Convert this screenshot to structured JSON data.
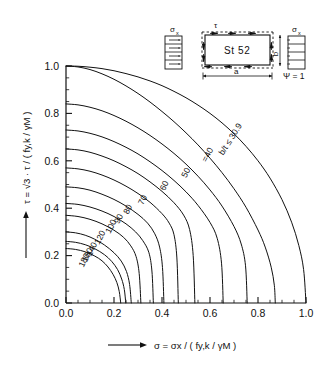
{
  "figure": {
    "material_label": "St 52",
    "psi_label": "Ψ = 1",
    "sigma_label_left": "σ",
    "sigma_sub_left": "x",
    "sigma_label_right": "σ",
    "sigma_sub_right": "x",
    "tau_label": "τ",
    "dim_a": "a",
    "dim_b": "b"
  },
  "axes": {
    "x": {
      "label_main": "σ",
      "label_full": "σ = σx / ( fy,k / γM )",
      "ticks": [
        "0.0",
        "0.2",
        "0.4",
        "0.6",
        "0.8",
        "1.0"
      ],
      "tick_values": [
        0.0,
        0.2,
        0.4,
        0.6,
        0.8,
        1.0
      ],
      "range": [
        0.0,
        1.0
      ],
      "minor_step": 0.05
    },
    "y": {
      "label_full": "τ = √3 · τ / ( fy,k / γM )",
      "ticks": [
        "0.0",
        "0.2",
        "0.4",
        "0.6",
        "0.8",
        "1.0"
      ],
      "tick_values": [
        0.0,
        0.2,
        0.4,
        0.6,
        0.8,
        1.0
      ],
      "range": [
        0.0,
        1.0
      ],
      "minor_step": 0.05
    }
  },
  "chart_data": {
    "type": "line",
    "title": "",
    "xlabel": "σ = σx / ( fy,k / γM )",
    "ylabel": "τ = √3 · τ / ( fy,k / γM )",
    "xlim": [
      0.0,
      1.0
    ],
    "ylim": [
      0.0,
      1.0
    ],
    "grid": false,
    "legend": "inline-curve-labels",
    "legend_title": "b/t",
    "series": [
      {
        "name": "b/t ≤ 30.9",
        "label": "b/t ≤ 30.9",
        "label_pos": [
          0.695,
          0.685
        ],
        "label_rot": -58,
        "x": [
          0.0,
          0.05,
          0.1,
          0.15,
          0.2,
          0.25,
          0.3,
          0.35,
          0.4,
          0.45,
          0.5,
          0.55,
          0.6,
          0.65,
          0.7,
          0.75,
          0.8,
          0.85,
          0.9,
          0.94,
          0.97,
          0.99,
          1.0
        ],
        "y": [
          1.0,
          0.999,
          0.995,
          0.989,
          0.98,
          0.968,
          0.954,
          0.937,
          0.917,
          0.893,
          0.866,
          0.835,
          0.8,
          0.76,
          0.714,
          0.661,
          0.6,
          0.527,
          0.436,
          0.341,
          0.243,
          0.141,
          0.0
        ]
      },
      {
        "name": "=40",
        "label": "=40",
        "label_pos": [
          0.6,
          0.62
        ],
        "label_rot": -62,
        "x": [
          0.0,
          0.05,
          0.1,
          0.15,
          0.2,
          0.25,
          0.3,
          0.35,
          0.4,
          0.45,
          0.5,
          0.55,
          0.6,
          0.65,
          0.7,
          0.75,
          0.8,
          0.83,
          0.855,
          0.868,
          0.872
        ],
        "y": [
          1.0,
          0.996,
          0.985,
          0.967,
          0.944,
          0.916,
          0.884,
          0.848,
          0.808,
          0.765,
          0.718,
          0.667,
          0.611,
          0.55,
          0.482,
          0.404,
          0.308,
          0.236,
          0.151,
          0.075,
          0.0
        ]
      },
      {
        "name": "50",
        "label": "50",
        "label_pos": [
          0.51,
          0.545
        ],
        "label_rot": -64,
        "x": [
          0.0,
          0.05,
          0.1,
          0.15,
          0.2,
          0.25,
          0.3,
          0.35,
          0.4,
          0.45,
          0.5,
          0.55,
          0.6,
          0.65,
          0.7,
          0.73,
          0.748,
          0.755
        ],
        "y": [
          0.84,
          0.836,
          0.826,
          0.811,
          0.791,
          0.767,
          0.739,
          0.707,
          0.671,
          0.631,
          0.586,
          0.535,
          0.477,
          0.409,
          0.323,
          0.249,
          0.157,
          0.0
        ]
      },
      {
        "name": "60",
        "label": "60",
        "label_pos": [
          0.42,
          0.49
        ],
        "label_rot": -64,
        "x": [
          0.0,
          0.05,
          0.1,
          0.15,
          0.2,
          0.25,
          0.3,
          0.35,
          0.4,
          0.45,
          0.5,
          0.55,
          0.6,
          0.63,
          0.648,
          0.655
        ],
        "y": [
          0.73,
          0.726,
          0.716,
          0.701,
          0.681,
          0.657,
          0.629,
          0.596,
          0.559,
          0.517,
          0.469,
          0.412,
          0.34,
          0.273,
          0.168,
          0.0
        ]
      },
      {
        "name": "70",
        "label": "70",
        "label_pos": [
          0.33,
          0.43
        ],
        "label_rot": -64,
        "x": [
          0.0,
          0.05,
          0.1,
          0.15,
          0.2,
          0.25,
          0.3,
          0.35,
          0.4,
          0.45,
          0.49,
          0.515,
          0.53,
          0.537
        ],
        "y": [
          0.65,
          0.646,
          0.636,
          0.62,
          0.6,
          0.575,
          0.546,
          0.511,
          0.471,
          0.423,
          0.371,
          0.31,
          0.2,
          0.0
        ]
      },
      {
        "name": "80",
        "label": "80",
        "label_pos": [
          0.268,
          0.39
        ],
        "label_rot": -64,
        "x": [
          0.0,
          0.05,
          0.1,
          0.15,
          0.2,
          0.25,
          0.3,
          0.35,
          0.4,
          0.43,
          0.45,
          0.462,
          0.468
        ],
        "y": [
          0.57,
          0.566,
          0.556,
          0.54,
          0.519,
          0.493,
          0.462,
          0.425,
          0.377,
          0.337,
          0.288,
          0.19,
          0.0
        ]
      },
      {
        "name": "90",
        "label": "90",
        "label_pos": [
          0.23,
          0.35
        ],
        "label_rot": -64,
        "x": [
          0.0,
          0.05,
          0.1,
          0.15,
          0.2,
          0.25,
          0.3,
          0.34,
          0.37,
          0.39,
          0.402,
          0.408
        ],
        "y": [
          0.49,
          0.486,
          0.476,
          0.459,
          0.437,
          0.409,
          0.374,
          0.337,
          0.292,
          0.236,
          0.15,
          0.0
        ]
      },
      {
        "name": "100",
        "label": "100",
        "label_pos": [
          0.198,
          0.318
        ],
        "label_rot": -64,
        "x": [
          0.0,
          0.05,
          0.1,
          0.15,
          0.2,
          0.25,
          0.29,
          0.32,
          0.345,
          0.358,
          0.364
        ],
        "y": [
          0.42,
          0.416,
          0.405,
          0.388,
          0.365,
          0.334,
          0.3,
          0.263,
          0.214,
          0.135,
          0.0
        ]
      },
      {
        "name": "120",
        "label": "120",
        "label_pos": [
          0.152,
          0.272
        ],
        "label_rot": -64,
        "x": [
          0.0,
          0.05,
          0.1,
          0.15,
          0.2,
          0.24,
          0.27,
          0.292,
          0.305,
          0.312
        ],
        "y": [
          0.37,
          0.365,
          0.353,
          0.334,
          0.307,
          0.277,
          0.241,
          0.196,
          0.124,
          0.0
        ]
      },
      {
        "name": "140",
        "label": "140",
        "label_pos": [
          0.118,
          0.222
        ],
        "label_rot": -64,
        "x": [
          0.0,
          0.04,
          0.08,
          0.12,
          0.16,
          0.2,
          0.23,
          0.252,
          0.265,
          0.272
        ],
        "y": [
          0.3,
          0.296,
          0.286,
          0.269,
          0.245,
          0.212,
          0.177,
          0.133,
          0.078,
          0.0
        ]
      },
      {
        "name": "160",
        "label": "160",
        "label_pos": [
          0.1,
          0.198
        ],
        "label_rot": -64,
        "x": [
          0.0,
          0.04,
          0.08,
          0.12,
          0.16,
          0.19,
          0.215,
          0.232,
          0.243,
          0.249
        ],
        "y": [
          0.26,
          0.256,
          0.246,
          0.229,
          0.204,
          0.176,
          0.141,
          0.101,
          0.057,
          0.0
        ]
      },
      {
        "name": "180",
        "label": "180",
        "label_pos": [
          0.086,
          0.176
        ],
        "label_rot": -64,
        "x": [
          0.0,
          0.04,
          0.08,
          0.12,
          0.15,
          0.175,
          0.196,
          0.212,
          0.222,
          0.228
        ],
        "y": [
          0.23,
          0.226,
          0.216,
          0.198,
          0.178,
          0.152,
          0.121,
          0.086,
          0.048,
          0.0
        ]
      }
    ]
  }
}
